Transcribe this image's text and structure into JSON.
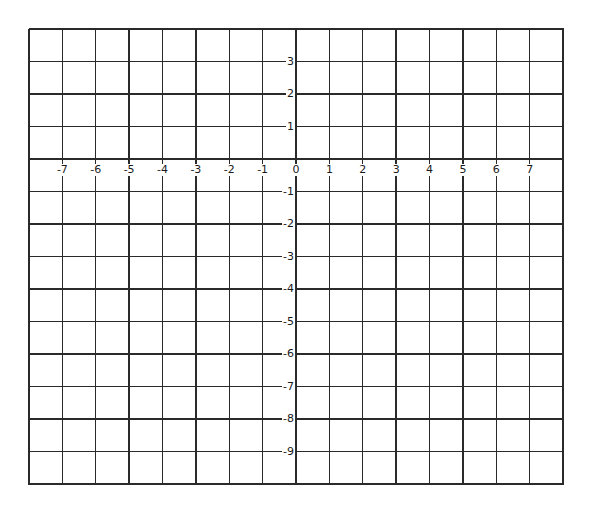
{
  "grid": {
    "left": 29,
    "right": 563,
    "top": 29,
    "bottom": 484,
    "columns": 16,
    "rows": 14,
    "line_color": "#2a2a2a",
    "x_label_row_top": 159,
    "x_label_offset": 5,
    "y_axis_line_index": 8
  },
  "chart_data": {
    "type": "coordinate-grid",
    "title": "",
    "x_tick_labels": [
      "-7",
      "-6",
      "-5",
      "-4",
      "-3",
      "-2",
      "-1",
      "0",
      "1",
      "2",
      "3",
      "4",
      "5",
      "6",
      "7"
    ],
    "x_tick_line_indices": [
      1,
      2,
      3,
      4,
      5,
      6,
      7,
      8,
      9,
      10,
      11,
      12,
      13,
      14,
      15
    ],
    "y_tick_labels": [
      "3",
      "2",
      "1",
      "-1",
      "-2",
      "-3",
      "-4",
      "-5",
      "-6",
      "-7",
      "-8",
      "-9"
    ],
    "y_tick_line_indices": [
      1,
      2,
      3,
      5,
      6,
      7,
      8,
      9,
      10,
      11,
      12,
      13
    ],
    "xlim": [
      -8,
      8
    ],
    "ylim": [
      -10,
      4
    ],
    "grid": true,
    "legend": null
  }
}
